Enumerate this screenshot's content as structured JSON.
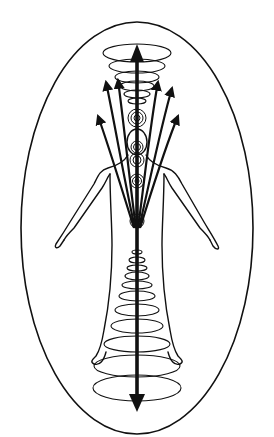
{
  "diagram": {
    "colors": {
      "background": "#ffffff",
      "stroke": "#111111"
    },
    "elements": {
      "aura": "outer-aura-ellipse",
      "figure": "human-figure-outline",
      "central_current": "vertical-double-arrow",
      "crown_vortex": "upward-spiral-rings",
      "root_vortex": "downward-spiral-rings",
      "chakras": [
        "crown",
        "third-eye",
        "throat",
        "heart",
        "solar-plexus",
        "sacral"
      ],
      "emanating_arrows": 6
    }
  }
}
